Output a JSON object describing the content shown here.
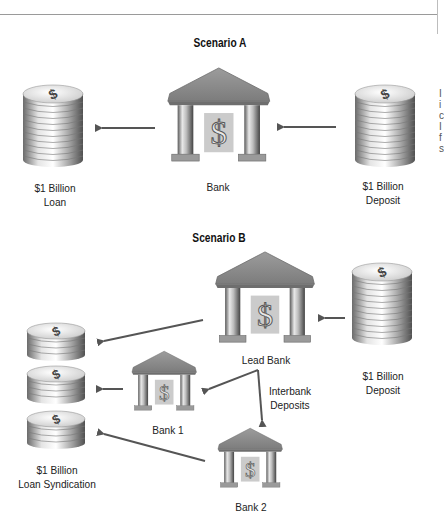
{
  "figure": {
    "side_text_fragments": [
      "I",
      "i",
      "c",
      "I",
      "f",
      "s"
    ]
  },
  "scenario_a": {
    "title": "Scenario A",
    "loan": {
      "line1": "$1 Billion",
      "line2": "Loan"
    },
    "bank": {
      "label": "Bank"
    },
    "deposit": {
      "line1": "$1 Billion",
      "line2": "Deposit"
    }
  },
  "scenario_b": {
    "title": "Scenario B",
    "lead_bank": {
      "label": "Lead Bank"
    },
    "deposit": {
      "line1": "$1 Billion",
      "line2": "Deposit"
    },
    "interbank": {
      "line1": "Interbank",
      "line2": "Deposits"
    },
    "bank1": {
      "label": "Bank 1"
    },
    "bank2": {
      "label": "Bank 2"
    },
    "syndication": {
      "line1": "$1 Billion",
      "line2": "Loan Syndication"
    }
  },
  "icons": {
    "currency_symbol": "$"
  },
  "colors": {
    "arrow": "#555555",
    "roof": "#8c8c8c",
    "dollar_panel": "#c9c9c9",
    "coin_light": "#f2f2f2",
    "coin_dark": "#7a7a7a"
  }
}
